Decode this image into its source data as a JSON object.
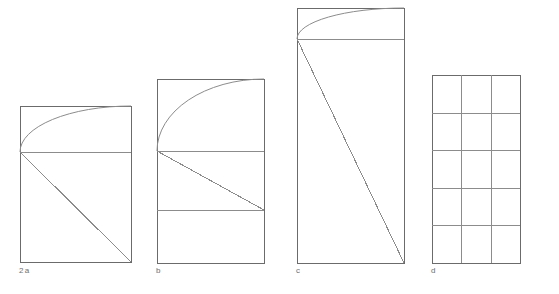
{
  "page": {
    "background_color": "#ffffff",
    "stroke_color": "#8c8c8c",
    "stroke_color_dark": "#6b6b6b",
    "label_color": "#6e6e6e",
    "width": 559,
    "height": 294
  },
  "figure_set": {
    "figure_number": "2",
    "panel_count": 4
  },
  "panels": [
    {
      "id": "a",
      "label": "a",
      "label_prefix": "2",
      "shape": "rectangle-with-arc-and-diagonal",
      "rect": {
        "x": 20,
        "y": 106,
        "width": 111,
        "height": 156
      },
      "arc": {
        "from_x": 20,
        "from_y": 152,
        "to_x": 131,
        "to_y": 106,
        "bulge": "outward-top"
      },
      "horizontal_lines_y": [
        152
      ],
      "diagonal": {
        "from_x": 20,
        "from_y": 152,
        "to_x": 131,
        "to_y": 262
      }
    },
    {
      "id": "b",
      "label": "b",
      "label_prefix": "",
      "shape": "rectangle-with-arc-two-horizontals-and-diagonal",
      "rect": {
        "x": 157,
        "y": 79,
        "width": 107,
        "height": 184
      },
      "arc": {
        "from_x": 157,
        "from_y": 151,
        "to_x": 264,
        "to_y": 79,
        "bulge": "outward-top"
      },
      "horizontal_lines_y": [
        151,
        210
      ],
      "diagonal": {
        "from_x": 157,
        "from_y": 151,
        "to_x": 264,
        "to_y": 210
      }
    },
    {
      "id": "c",
      "label": "c",
      "label_prefix": "",
      "shape": "tall-rectangle-with-arc-horizontal-and-long-diagonal",
      "rect": {
        "x": 297,
        "y": 8,
        "width": 107,
        "height": 255
      },
      "arc": {
        "from_x": 297,
        "from_y": 39,
        "to_x": 404,
        "to_y": 8,
        "bulge": "outward-top"
      },
      "horizontal_lines_y": [
        39
      ],
      "diagonal": {
        "from_x": 297,
        "from_y": 39,
        "to_x": 404,
        "to_y": 263
      }
    },
    {
      "id": "d",
      "label": "d",
      "label_prefix": "",
      "shape": "grid",
      "rect": {
        "x": 432,
        "y": 75,
        "width": 88,
        "height": 188
      },
      "grid_columns": 3,
      "grid_rows": 5
    }
  ]
}
